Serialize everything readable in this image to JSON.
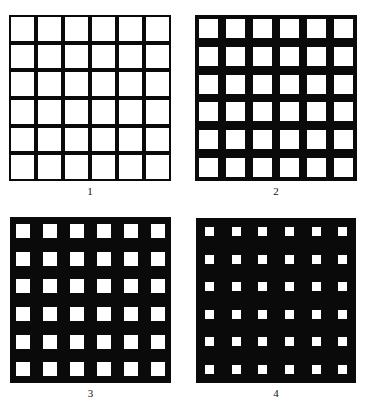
{
  "figure": {
    "grid_rows": 6,
    "grid_cols": 6,
    "background_color": "#ffffff",
    "line_color": "#0a0a0a",
    "cell_color": "#ffffff",
    "panels": [
      {
        "label": "1",
        "x": 9,
        "y": 15,
        "width": 162,
        "height": 166,
        "cell_size": 23.5
      },
      {
        "label": "2",
        "x": 195,
        "y": 15,
        "width": 162,
        "height": 166,
        "cell_size": 19
      },
      {
        "label": "3",
        "x": 10,
        "y": 217,
        "width": 161,
        "height": 166,
        "cell_size": 14
      },
      {
        "label": "4",
        "x": 196,
        "y": 218,
        "width": 160,
        "height": 165,
        "cell_size": 9
      }
    ]
  }
}
